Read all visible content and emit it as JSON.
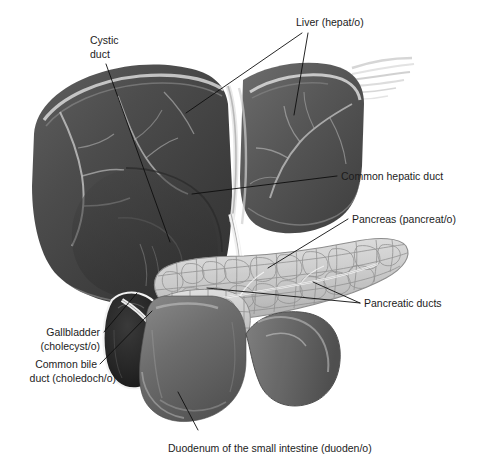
{
  "figure": {
    "background_color": "#ffffff",
    "line_color": "#0d0d0d",
    "text_color": "#1c1c1c",
    "width": 482,
    "height": 466
  },
  "labels": {
    "liver": {
      "text": "Liver (hepat/o)",
      "x": 296,
      "y": 26
    },
    "cystic_duct_line1": {
      "text": "Cystic",
      "x": 90,
      "y": 44
    },
    "cystic_duct_line2": {
      "text": "duct",
      "x": 90,
      "y": 58
    },
    "common_hepatic_duct": {
      "text": "Common hepatic duct",
      "x": 341,
      "y": 180
    },
    "pancreas": {
      "text": "Pancreas (pancreat/o)",
      "x": 352,
      "y": 223
    },
    "pancreatic_ducts": {
      "text": "Pancreatic ducts",
      "x": 364,
      "y": 307
    },
    "gallbladder_line1": {
      "text": "Gallbladder",
      "x": 36,
      "y": 336
    },
    "gallbladder_line2": {
      "text": "(cholecyst/o)",
      "x": 29,
      "y": 350
    },
    "common_bile_duct_line1": {
      "text": "Common bile",
      "x": 36,
      "y": 368
    },
    "common_bile_duct_line2": {
      "text": "duct (choledoch/o)",
      "x": 25,
      "y": 382
    },
    "duodenum": {
      "text": "Duodenum of the small intestine (duoden/o)",
      "x": 168,
      "y": 452
    }
  },
  "organs": {
    "liver": {
      "name": "liver",
      "tone": "#4a4a4a"
    },
    "gallbladder": {
      "name": "gallbladder",
      "tone": "#2a2a2a"
    },
    "pancreas": {
      "name": "pancreas",
      "tone": "#cfcfcf"
    },
    "duodenum": {
      "name": "duodenum",
      "tone": "#6a6a6a"
    },
    "common_bile_duct": {
      "name": "common-bile-duct",
      "tone": "#e8e8e8"
    },
    "common_hepatic_duct": {
      "name": "common-hepatic-duct",
      "tone": "#e0e0e0"
    },
    "cystic_duct": {
      "name": "cystic-duct",
      "tone": "#d8d8d8"
    }
  }
}
